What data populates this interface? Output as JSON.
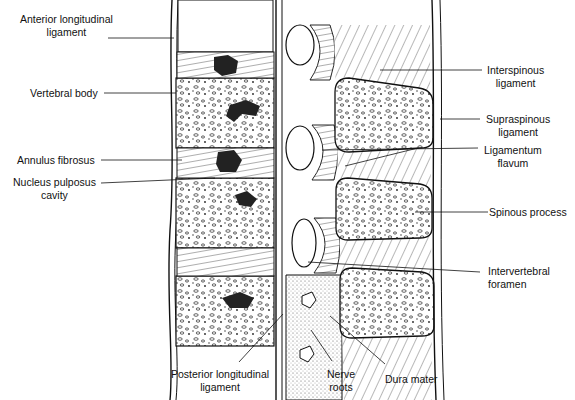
{
  "diagram": {
    "labels_left": [
      {
        "id": "anterior-longitudinal-ligament",
        "line1": "Anterior longitudinal",
        "line2": "ligament"
      },
      {
        "id": "vertebral-body",
        "line1": "Vertebral body",
        "line2": ""
      },
      {
        "id": "annulus-fibrosus",
        "line1": "Annulus fibrosus",
        "line2": ""
      },
      {
        "id": "nucleus-pulposus-cavity",
        "line1": "Nucleus pulposus",
        "line2": "cavity"
      }
    ],
    "labels_right": [
      {
        "id": "interspinous-ligament",
        "line1": "Interspinous",
        "line2": "ligament"
      },
      {
        "id": "supraspinous-ligament",
        "line1": "Supraspinous",
        "line2": "ligament"
      },
      {
        "id": "ligamentum-flavum",
        "line1": "Ligamentum",
        "line2": "flavum"
      },
      {
        "id": "spinous-process",
        "line1": "Spinous process",
        "line2": ""
      },
      {
        "id": "intervertebral-foramen",
        "line1": "Intervertebral",
        "line2": "foramen"
      }
    ],
    "labels_bottom": [
      {
        "id": "posterior-longitudinal-ligament",
        "line1": "Posterior longitudinal",
        "line2": "ligament"
      },
      {
        "id": "nerve-roots",
        "line1": "Nerve",
        "line2": "roots"
      },
      {
        "id": "dura-mater",
        "line1": "Dura mater",
        "line2": ""
      }
    ]
  }
}
